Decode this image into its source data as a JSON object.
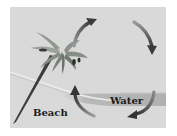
{
  "diagram": {
    "type": "sea-breeze-circulation",
    "labels": {
      "beach": "Beach",
      "water": "Water"
    },
    "elements": [
      {
        "name": "palm-tree",
        "description": "Palm tree leaning on beach"
      },
      {
        "name": "water-band",
        "description": "Sea surface band on right"
      },
      {
        "name": "shoreline",
        "description": "Curved shoreline line"
      },
      {
        "name": "circulation-arrows",
        "count": 4,
        "direction": "clockwise"
      }
    ],
    "colors": {
      "background": "#ffffff",
      "panel": "#d9d9d9",
      "water": "#b5b5b5",
      "arrow": "#3a3a3a",
      "palm_leaf": "#8a948a",
      "trunk": "#3c3c3c",
      "text": "#1a1a1a"
    }
  }
}
